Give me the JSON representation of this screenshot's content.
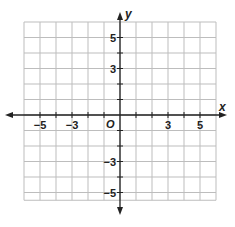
{
  "chart_data": {
    "type": "coordinate-grid",
    "title": "",
    "xlabel": "x",
    "ylabel": "y",
    "origin_label": "O",
    "xlim": [
      -6,
      6
    ],
    "ylim": [
      -5.5,
      6
    ],
    "grid": true,
    "grid_step": 1,
    "x_tick_labels": [
      {
        "value": -5,
        "label": "−5"
      },
      {
        "value": -3,
        "label": "−3"
      },
      {
        "value": 3,
        "label": "3"
      },
      {
        "value": 5,
        "label": "5"
      }
    ],
    "y_tick_labels": [
      {
        "value": 5,
        "label": "5"
      },
      {
        "value": 3,
        "label": "3"
      },
      {
        "value": -3,
        "label": "−3"
      },
      {
        "value": -5,
        "label": "−5"
      }
    ]
  },
  "colors": {
    "grid": "#bdbdbd",
    "axis": "#222222",
    "background": "#ffffff"
  }
}
